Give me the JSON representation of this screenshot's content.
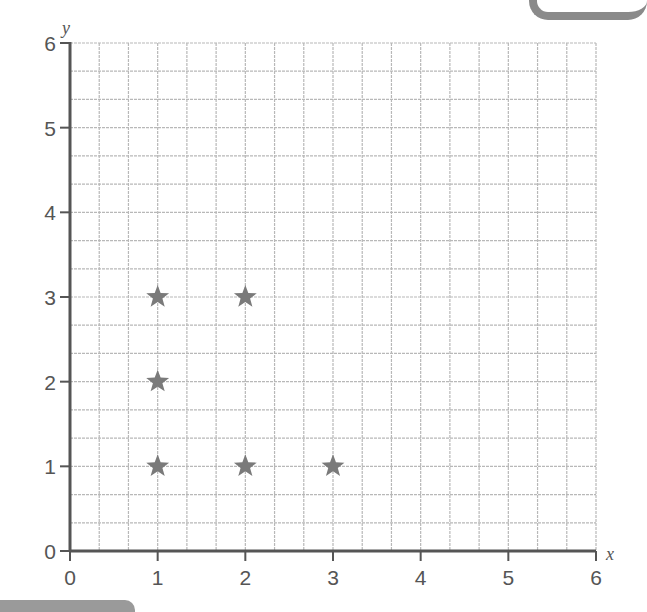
{
  "chart_data": {
    "type": "scatter",
    "title": "",
    "xlabel": "x",
    "ylabel": "y",
    "xlim": [
      0,
      6
    ],
    "ylim": [
      0,
      6
    ],
    "x_ticks": [
      "0",
      "1",
      "2",
      "3",
      "4",
      "5",
      "6"
    ],
    "y_ticks": [
      "0",
      "1",
      "2",
      "3",
      "4",
      "5",
      "6"
    ],
    "grid": true,
    "minor_divisions_per_unit": 3,
    "marker": "star",
    "marker_color": "#7a7a7a",
    "points": [
      {
        "x": 1,
        "y": 1
      },
      {
        "x": 2,
        "y": 1
      },
      {
        "x": 3,
        "y": 1
      },
      {
        "x": 1,
        "y": 2
      },
      {
        "x": 1,
        "y": 3
      },
      {
        "x": 2,
        "y": 3
      }
    ],
    "legend": null
  },
  "colors": {
    "axis": "#555555",
    "grid": "#b8b8b8",
    "marker": "#7a7a7a"
  }
}
